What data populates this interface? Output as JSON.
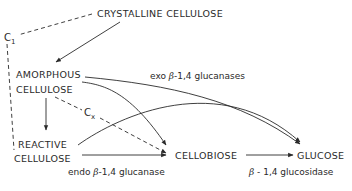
{
  "nodes": {
    "crystalline": "CRYSTALLINE  CELLULOSE",
    "amorphous_line1": "AMORPHOUS",
    "amorphous_line2": "CELLULOSE",
    "reactive_line1": "REACTIVE",
    "reactive_line2": "CELLULOSE",
    "cellobiose": "CELLOBIOSE",
    "glucose": "GLUCOSE"
  },
  "enzymes": {
    "c1_main": "C",
    "c1_sub": "1",
    "cx_main": "C",
    "cx_sub": "x",
    "exo_prefix": "exo ",
    "exo_beta": "β",
    "exo_suffix": "-1,4 glucanases",
    "endo_prefix": "endo ",
    "endo_beta": "β",
    "endo_suffix": "-1,4 glucanase",
    "glucosidase_beta": "β",
    "glucosidase_suffix": " - 1,4 glucosidase"
  },
  "colors": {
    "ink": "#2a2a2a",
    "background": "#ffffff"
  }
}
